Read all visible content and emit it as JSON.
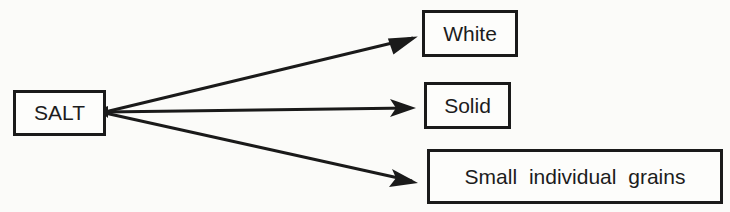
{
  "diagram": {
    "source": {
      "label": "SALT"
    },
    "targets": [
      {
        "label": "White"
      },
      {
        "label": "Solid"
      },
      {
        "label": "Small individual grains"
      }
    ],
    "edges": [
      {
        "from": "SALT",
        "to": "White"
      },
      {
        "from": "SALT",
        "to": "Solid"
      },
      {
        "from": "SALT",
        "to": "Small individual grains"
      }
    ],
    "colors": {
      "line": "#1a1a1a",
      "background": "#fbfbf9"
    }
  }
}
